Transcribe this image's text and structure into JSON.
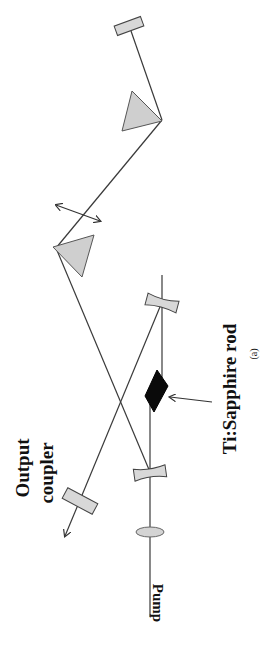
{
  "diagram": {
    "type": "optical-layout",
    "labels": {
      "output_coupler_line1": "Output",
      "output_coupler_line2": "coupler",
      "crystal": "Ti:Sapphire rod",
      "pump": "Pump",
      "figure_tag": "(a)"
    },
    "components": [
      {
        "id": "end-mirror",
        "kind": "flat-mirror"
      },
      {
        "id": "prism-1",
        "kind": "prism"
      },
      {
        "id": "prism-2",
        "kind": "prism"
      },
      {
        "id": "curved-mirror-1",
        "kind": "curved-mirror"
      },
      {
        "id": "curved-mirror-2",
        "kind": "curved-mirror"
      },
      {
        "id": "ti-sapphire-rod",
        "kind": "gain-crystal"
      },
      {
        "id": "output-coupler",
        "kind": "flat-mirror"
      },
      {
        "id": "pump-lens",
        "kind": "lens"
      }
    ],
    "colors": {
      "beam": "#3a3a3a",
      "optic_fill": "#d8d8d8",
      "crystal_fill": "#0a0a0a"
    }
  }
}
